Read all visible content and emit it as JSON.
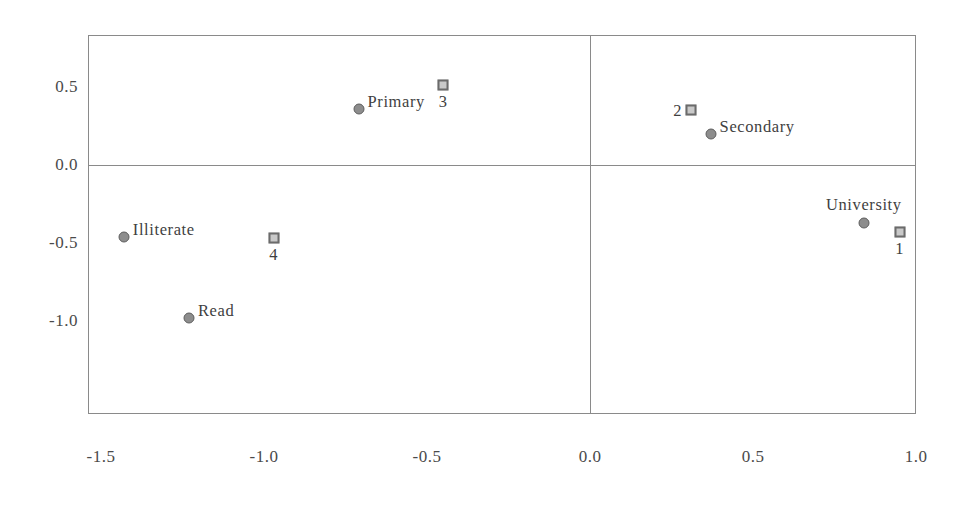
{
  "chart_data": {
    "type": "scatter",
    "title": "",
    "xlabel": "",
    "ylabel": "",
    "xlim": [
      -1.6,
      1.05
    ],
    "ylim": [
      -1.35,
      0.72
    ],
    "grid": false,
    "legend": "none",
    "xticks": [
      "-1.5",
      "-1.0",
      "-0.5",
      "0.0",
      "0.5",
      "1.0"
    ],
    "xtick_values": [
      -1.5,
      -1.0,
      -0.5,
      0.0,
      0.5,
      1.0
    ],
    "yticks": [
      "0.5",
      "0.0",
      "-0.5",
      "-1.0"
    ],
    "ytick_values": [
      0.5,
      0.0,
      -0.5,
      -1.0
    ],
    "reference_lines": {
      "vertical_at_x": 0.0,
      "horizontal_at_y": 0.0
    },
    "series": [
      {
        "name": "Education level (circle markers)",
        "marker": "circle",
        "color": "#8d8d8d",
        "points": [
          {
            "label": "Primary",
            "x": -0.71,
            "y": 0.36,
            "label_pos": "right"
          },
          {
            "label": "Secondary",
            "x": 0.37,
            "y": 0.2,
            "label_pos": "right"
          },
          {
            "label": "University",
            "x": 0.84,
            "y": -0.37,
            "label_pos": "above"
          },
          {
            "label": "Illiterate",
            "x": -1.43,
            "y": -0.46,
            "label_pos": "right"
          },
          {
            "label": "Read",
            "x": -1.23,
            "y": -0.98,
            "label_pos": "right"
          }
        ]
      },
      {
        "name": "Category codes (square markers)",
        "marker": "square",
        "color": "#c9c9c9",
        "points": [
          {
            "label": "3",
            "x": -0.45,
            "y": 0.51,
            "label_pos": "below"
          },
          {
            "label": "2",
            "x": 0.31,
            "y": 0.35,
            "label_pos": "left"
          },
          {
            "label": "1",
            "x": 0.95,
            "y": -0.43,
            "label_pos": "below"
          },
          {
            "label": "4",
            "x": -0.97,
            "y": -0.47,
            "label_pos": "below"
          }
        ]
      }
    ]
  }
}
